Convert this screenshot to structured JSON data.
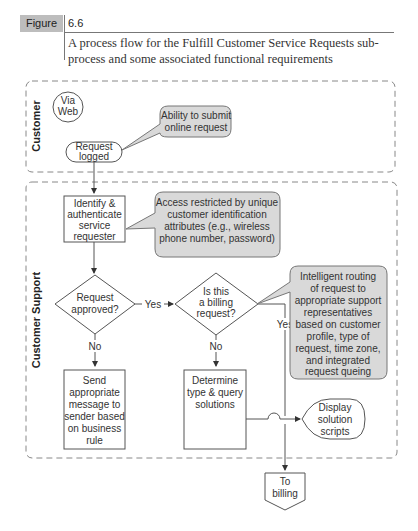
{
  "figure": {
    "label": "Figure",
    "number": "6.6",
    "caption": "A process flow for the Fulfill Customer Service Requests sub-process and some associated functional requirements",
    "label_bg": "#bdbdbd"
  },
  "lanes": [
    {
      "name": "Customer"
    },
    {
      "name": "Customer Support"
    }
  ],
  "nodes": {
    "via_web": {
      "lines": [
        "Via",
        "Web"
      ]
    },
    "request_logged": {
      "lines": [
        "Request",
        "logged"
      ]
    },
    "identify": {
      "lines": [
        "Identify &",
        "authenticate",
        "service",
        "requester"
      ]
    },
    "request_approved": {
      "lines": [
        "Request",
        "approved?"
      ]
    },
    "billing_question": {
      "lines": [
        "Is this",
        "a billing",
        "request?"
      ]
    },
    "send_message": {
      "lines": [
        "Send",
        "appropriate",
        "message to",
        "sender based",
        "on business",
        "rule"
      ]
    },
    "determine_type": {
      "lines": [
        "Determine",
        "type & query",
        "solutions"
      ]
    },
    "display_scripts": {
      "lines": [
        "Display",
        "solution",
        "scripts"
      ]
    },
    "to_billing": {
      "lines": [
        "To",
        "billing"
      ]
    }
  },
  "callouts": {
    "submit_online": {
      "lines": [
        "Ability to submit",
        "online request"
      ]
    },
    "access_restricted": {
      "lines": [
        "Access restricted by unique",
        "customer identification",
        "attributes (e.g., wireless",
        "phone number, password)"
      ]
    },
    "intelligent_routing": {
      "lines": [
        "Intelligent routing",
        "of request to",
        "appropriate support",
        "representatives",
        "based on customer",
        "profile, type of",
        "request, time zone,",
        "and integrated",
        "request queing"
      ]
    }
  },
  "edge_labels": {
    "approved_yes": "Yes",
    "approved_no": "No",
    "billing_yes": "Yes",
    "billing_no": "No"
  }
}
